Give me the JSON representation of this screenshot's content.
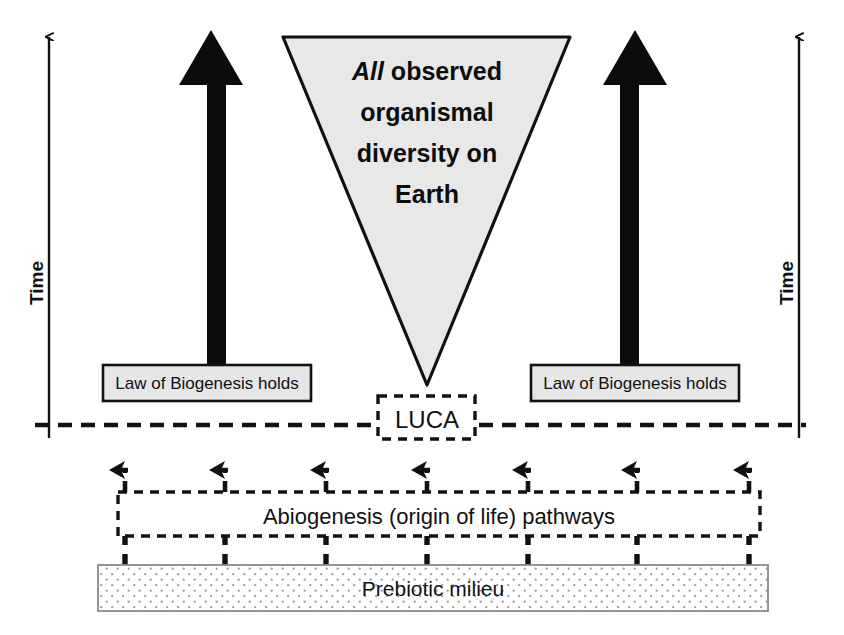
{
  "figure": {
    "background_color": "#ffffff"
  },
  "axes": {
    "left_time_label": "Time",
    "right_time_label": "Time",
    "direction": "upward"
  },
  "triangle": {
    "emphasis_word": "All",
    "line1_rest": " observed",
    "line2": "organismal",
    "line3": "diversity on",
    "line4": "Earth",
    "full_text": "All observed organismal diversity on Earth",
    "fill_color": "#e8e8e8",
    "stroke_color": "#111111"
  },
  "biogenesis": {
    "left_label": "Law of Biogenesis holds",
    "right_label": "Law of Biogenesis holds",
    "fill_color": "#e6e6e6",
    "stroke_color": "#111111"
  },
  "luca": {
    "label": "LUCA",
    "border_style": "dashed"
  },
  "divider": {
    "style": "dashed",
    "color": "#111111"
  },
  "abiogenesis": {
    "label": "Abiogenesis (origin of life) pathways",
    "border_style": "dashed",
    "pathway_count": 7
  },
  "prebiotic": {
    "label": "Prebiotic milieu",
    "fill_pattern": "dotted",
    "stroke_color": "#8a8a8a"
  },
  "arrows": {
    "big_left_name": "thick-upward-arrow-left",
    "big_right_name": "thick-upward-arrow-right",
    "pathway_arrow_name": "dashed-upward-arrow"
  },
  "colors": {
    "ink": "#111111",
    "triangle_fill": "#e8e8e8",
    "box_fill": "#e6e6e6",
    "dot_color": "#9a9a9a"
  }
}
